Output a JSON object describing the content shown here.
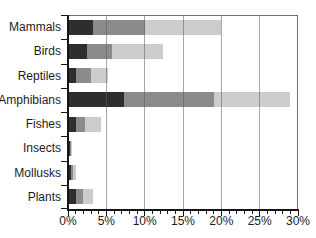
{
  "chart_data": {
    "type": "bar",
    "orientation": "horizontal",
    "stacked": true,
    "title": "",
    "categories": [
      "Mammals",
      "Birds",
      "Reptiles",
      "Amphibians",
      "Fishes",
      "Insects",
      "Mollusks",
      "Plants"
    ],
    "series": [
      {
        "name": "dark-segment",
        "color": "#2e2e2e",
        "values": [
          3.3,
          2.5,
          1.0,
          7.3,
          1.0,
          0.25,
          0.4,
          1.0
        ]
      },
      {
        "name": "medium-segment",
        "color": "#8b8b8b",
        "values": [
          6.7,
          3.3,
          2.0,
          11.8,
          1.2,
          0.1,
          0.25,
          0.9
        ]
      },
      {
        "name": "light-segment",
        "color": "#cccccc",
        "values": [
          10.0,
          6.6,
          2.2,
          9.9,
          2.1,
          0.15,
          0.35,
          1.3
        ]
      }
    ],
    "totals": [
      20.0,
      12.4,
      5.2,
      29.0,
      4.3,
      0.5,
      1.0,
      3.2
    ],
    "x_ticks": [
      "0%",
      "5%",
      "10%",
      "15%",
      "20%",
      "25%",
      "30%"
    ],
    "xlim": [
      0,
      30
    ],
    "x_major_step": 5,
    "x_minor_step": 1,
    "grid": "vertical-major-over-bars",
    "legend": "none",
    "xlabel": "",
    "ylabel": ""
  },
  "style": {
    "background": "#ffffff",
    "axis_color": "#161616",
    "frame_color": "#6f6f6f",
    "gridline_color": "#5f5f5f",
    "label_color": "#1c1c1c"
  }
}
